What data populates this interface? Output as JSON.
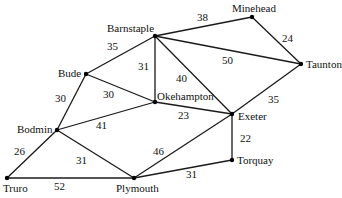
{
  "graph": {
    "nodes": [
      {
        "id": "barnstaple",
        "label": "Barnstaple",
        "x": 155,
        "y": 36,
        "lx": 107,
        "ly": 32
      },
      {
        "id": "minehead",
        "label": "Minehead",
        "x": 252,
        "y": 17,
        "lx": 232,
        "ly": 12
      },
      {
        "id": "taunton",
        "label": "Taunton",
        "x": 301,
        "y": 64,
        "lx": 306,
        "ly": 68
      },
      {
        "id": "bude",
        "label": "Bude",
        "x": 86,
        "y": 74,
        "lx": 58,
        "ly": 77
      },
      {
        "id": "okehampton",
        "label": "Okehampton",
        "x": 155,
        "y": 102,
        "lx": 157,
        "ly": 100
      },
      {
        "id": "exeter",
        "label": "Exeter",
        "x": 232,
        "y": 114,
        "lx": 238,
        "ly": 120
      },
      {
        "id": "bodmin",
        "label": "Bodmin",
        "x": 57,
        "y": 130,
        "lx": 17,
        "ly": 133
      },
      {
        "id": "truro",
        "label": "Truro",
        "x": 7,
        "y": 178,
        "lx": 3,
        "ly": 192
      },
      {
        "id": "plymouth",
        "label": "Plymouth",
        "x": 134,
        "y": 178,
        "lx": 116,
        "ly": 192
      },
      {
        "id": "torquay",
        "label": "Torquay",
        "x": 232,
        "y": 160,
        "lx": 237,
        "ly": 164
      }
    ],
    "edges": [
      {
        "from": "barnstaple",
        "to": "minehead",
        "weight": "38",
        "wx": 197,
        "wy": 21
      },
      {
        "from": "minehead",
        "to": "taunton",
        "weight": "24",
        "wx": 282,
        "wy": 42
      },
      {
        "from": "barnstaple",
        "to": "taunton",
        "weight": "50",
        "wx": 222,
        "wy": 64
      },
      {
        "from": "barnstaple",
        "to": "bude",
        "weight": "35",
        "wx": 107,
        "wy": 50
      },
      {
        "from": "barnstaple",
        "to": "okehampton",
        "weight": "31",
        "wx": 138,
        "wy": 70
      },
      {
        "from": "barnstaple",
        "to": "exeter",
        "weight": "40",
        "wx": 176,
        "wy": 82
      },
      {
        "from": "taunton",
        "to": "exeter",
        "weight": "35",
        "wx": 268,
        "wy": 103
      },
      {
        "from": "bude",
        "to": "okehampton",
        "weight": "30",
        "wx": 103,
        "wy": 98
      },
      {
        "from": "bude",
        "to": "bodmin",
        "weight": "30",
        "wx": 55,
        "wy": 102
      },
      {
        "from": "okehampton",
        "to": "exeter",
        "weight": "23",
        "wx": 178,
        "wy": 119
      },
      {
        "from": "bodmin",
        "to": "okehampton",
        "weight": "41",
        "wx": 96,
        "wy": 129
      },
      {
        "from": "bodmin",
        "to": "truro",
        "weight": "26",
        "wx": 14,
        "wy": 155
      },
      {
        "from": "bodmin",
        "to": "plymouth",
        "weight": "31",
        "wx": 76,
        "wy": 164
      },
      {
        "from": "truro",
        "to": "plymouth",
        "weight": "52",
        "wx": 54,
        "wy": 190
      },
      {
        "from": "plymouth",
        "to": "exeter",
        "weight": "46",
        "wx": 153,
        "wy": 155
      },
      {
        "from": "exeter",
        "to": "torquay",
        "weight": "22",
        "wx": 240,
        "wy": 142
      },
      {
        "from": "plymouth",
        "to": "torquay",
        "weight": "31",
        "wx": 186,
        "wy": 178
      }
    ]
  }
}
